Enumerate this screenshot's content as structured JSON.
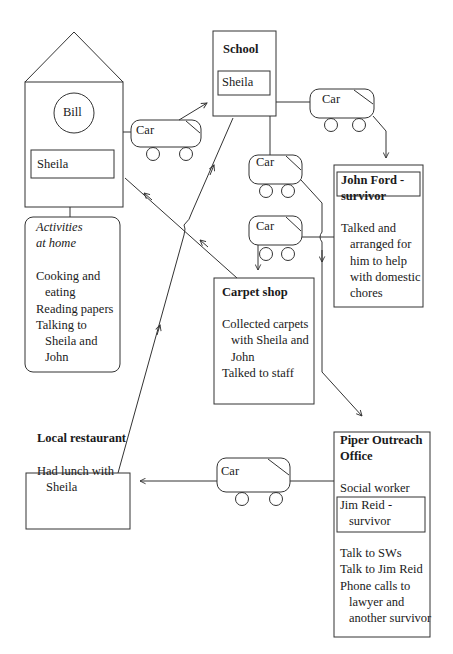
{
  "house": {
    "person": "Bill",
    "resident": "Sheila",
    "activities_title_line1": "Activities",
    "activities_title_line2": "at home",
    "activities": [
      {
        "text": "Cooking and",
        "indent": false
      },
      {
        "text": "eating",
        "indent": true
      },
      {
        "text": "Reading papers",
        "indent": false
      },
      {
        "text": "Talking to",
        "indent": false
      },
      {
        "text": "Sheila and",
        "indent": true
      },
      {
        "text": "John",
        "indent": true
      }
    ]
  },
  "school": {
    "title": "School",
    "person": "Sheila"
  },
  "john_ford": {
    "title_line1": "John Ford -",
    "title_line2": "survivor",
    "notes": [
      {
        "text": "Talked and",
        "indent": false
      },
      {
        "text": "arranged for",
        "indent": true
      },
      {
        "text": "him to help",
        "indent": true
      },
      {
        "text": "with domestic",
        "indent": true
      },
      {
        "text": "chores",
        "indent": true
      }
    ]
  },
  "carpet_shop": {
    "title": "Carpet shop",
    "notes": [
      {
        "text": "Collected carpets",
        "indent": false
      },
      {
        "text": "with Sheila and",
        "indent": true
      },
      {
        "text": "John",
        "indent": true
      },
      {
        "text": "Talked to staff",
        "indent": false
      }
    ]
  },
  "local_restaurant": {
    "title": "Local restaurant",
    "notes": [
      {
        "text": "Had lunch with",
        "indent": false
      },
      {
        "text": "Sheila",
        "indent": true
      }
    ]
  },
  "piper_outreach": {
    "title_line1": "Piper Outreach",
    "title_line2": "Office",
    "role": "Social worker",
    "survivor_line1": "Jim Reid -",
    "survivor_line2": "survivor",
    "notes": [
      {
        "text": "Talk to SWs",
        "indent": false
      },
      {
        "text": "Talk to Jim Reid",
        "indent": false
      },
      {
        "text": "Phone calls to",
        "indent": false
      },
      {
        "text": "lawyer and",
        "indent": true
      },
      {
        "text": "another survivor",
        "indent": true
      }
    ]
  },
  "cars": [
    {
      "label": "Car"
    },
    {
      "label": "Car"
    },
    {
      "label": "Car"
    },
    {
      "label": "Car"
    },
    {
      "label": "Car"
    }
  ]
}
